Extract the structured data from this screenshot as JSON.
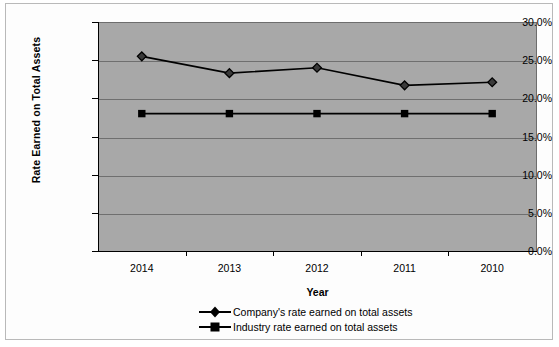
{
  "chart_data": {
    "type": "line",
    "title": "",
    "xlabel": "Year",
    "ylabel": "Rate Earned on Total Assets",
    "categories": [
      "2014",
      "2013",
      "2012",
      "2011",
      "2010"
    ],
    "ylim": [
      0,
      30
    ],
    "ytick_labels": [
      "30.0%",
      "25.0%",
      "20.0%",
      "15.0%",
      "10.0%",
      "5.0%",
      "0.0%"
    ],
    "ytick_values": [
      30.0,
      25.0,
      20.0,
      15.0,
      10.0,
      5.0,
      0.0
    ],
    "grid": true,
    "legend_position": "bottom",
    "plot_background": "#a8a8a8",
    "series": [
      {
        "name": "Company's rate earned on total assets",
        "marker": "diamond",
        "color": "#000000",
        "values": [
          25.5,
          23.3,
          24.0,
          21.7,
          22.1
        ]
      },
      {
        "name": "Industry rate earned on total assets",
        "marker": "square",
        "color": "#000000",
        "values": [
          18.0,
          18.0,
          18.0,
          18.0,
          18.0
        ]
      }
    ]
  },
  "legend": {
    "items": [
      {
        "label": "Company's rate earned on total assets",
        "marker": "diamond"
      },
      {
        "label": "Industry rate earned on total assets",
        "marker": "square"
      }
    ]
  },
  "axes": {
    "y_title": "Rate Earned on Total Assets",
    "x_title": "Year"
  }
}
